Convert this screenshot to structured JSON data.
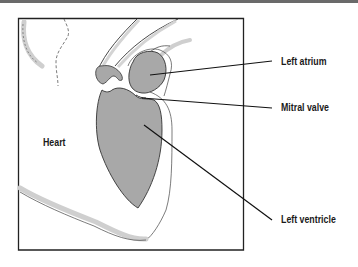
{
  "diagram": {
    "colors": {
      "chamber_fill": "#a8a8a8",
      "outline": "#333333",
      "frame": "#222222",
      "topbar": "#6a6a6a",
      "vessel_shadow": "#c8c8c8"
    },
    "labels": {
      "heart": "Heart",
      "left_atrium": "Left atrium",
      "mitral_valve": "Mitral valve",
      "left_ventricle": "Left ventricle"
    }
  }
}
